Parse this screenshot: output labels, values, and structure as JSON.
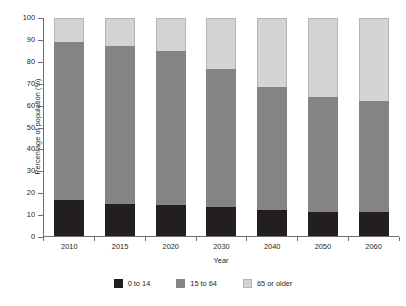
{
  "chart_data": {
    "type": "bar",
    "stacked": true,
    "title": "",
    "xlabel": "Year",
    "ylabel": "Percentage of population (%)",
    "categories": [
      "2010",
      "2015",
      "2020",
      "2030",
      "2040",
      "2050",
      "2060"
    ],
    "ylim": [
      0,
      100
    ],
    "yticks": [
      0,
      10,
      20,
      30,
      40,
      50,
      60,
      70,
      80,
      90,
      100
    ],
    "ytick_labels": [
      "0",
      "10",
      "20",
      "30",
      "40",
      "50",
      "60",
      "70",
      "80",
      "90",
      "100"
    ],
    "grid": false,
    "legend_position": "bottom",
    "series": [
      {
        "name": "0 to 14",
        "color": "#231f20",
        "values": [
          16.5,
          14.5,
          14,
          13.5,
          12,
          11,
          11
        ]
      },
      {
        "name": "15 to 64",
        "color": "#848484",
        "values": [
          72.5,
          72.5,
          71,
          63,
          56.5,
          53,
          51
        ]
      },
      {
        "name": "65 or older",
        "color": "#d4d4d4",
        "values": [
          11,
          13,
          15,
          23.5,
          31.5,
          36,
          38
        ]
      }
    ],
    "cumulative_tops": {
      "young": [
        16.5,
        14.5,
        14,
        13.5,
        12,
        11,
        11
      ],
      "working": [
        89,
        87,
        85,
        76.5,
        68.5,
        64,
        62
      ],
      "older": [
        100,
        100,
        100,
        100,
        100,
        100,
        100
      ]
    }
  },
  "legend": {
    "items": [
      {
        "label": "0 to 14",
        "swatch": "swatch-dark"
      },
      {
        "label": "15 to 64",
        "swatch": "swatch-medium-gray"
      },
      {
        "label": "65 or older",
        "swatch": "swatch-light-gray"
      }
    ]
  },
  "colors": {
    "young": "#231f20",
    "working": "#848484",
    "older": "#d4d4d4",
    "axis": "#6d6e71",
    "text": "#231f20",
    "background": "#ffffff"
  }
}
